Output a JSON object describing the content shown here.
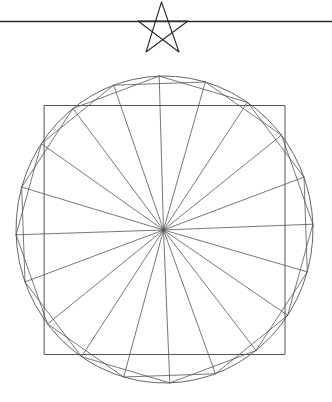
{
  "figure": {
    "background": "#ffffff",
    "stroke_color": "#2a2a2a",
    "stroke_light": "#555555",
    "top_rule": {
      "x1": 0,
      "y1": 21.5,
      "x2": 332,
      "y2": 21.5
    },
    "pentagram": {
      "points": [
        [
          161.5,
          2
        ],
        [
          179,
          52
        ],
        [
          138,
          21
        ],
        [
          188,
          21
        ],
        [
          146,
          52
        ]
      ]
    },
    "outer_circle": {
      "cx": 164.5,
      "cy": 229.5,
      "rx": 148.5,
      "ry": 153.5,
      "rotation_deg": -1.2
    },
    "square": {
      "x": 44.5,
      "y": 105.5,
      "width": 240.5,
      "height": 249
    },
    "polygon_vertices": {
      "count": 20,
      "start_angle_deg": 0.8,
      "step_deg": 18,
      "chord_skip": 2,
      "radial_lines_to_center": true
    }
  }
}
